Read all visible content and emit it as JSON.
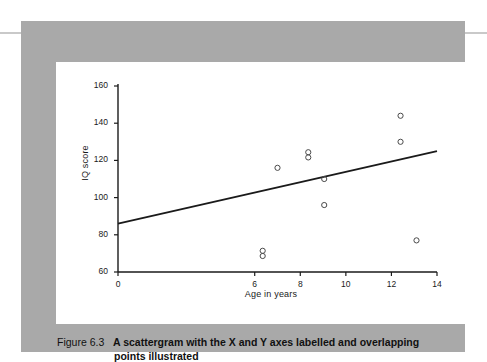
{
  "figure": {
    "number_label": "Figure 6.3",
    "caption_line1": "A scattergram with the X and Y axes labelled and overlapping",
    "caption_line2": "points illustrated"
  },
  "colors": {
    "panel_background": "#ffffff",
    "block_background": "#a9a9a9",
    "axis": "#1a1a1a",
    "trendline": "#1a1a1a",
    "marker_stroke": "#4a4a4a",
    "edge_rule": "#c9c9c9"
  },
  "chart_data": {
    "type": "scatter",
    "title": "",
    "subtitle": "",
    "xlabel": "Age in years",
    "ylabel": "IQ score",
    "xlim": [
      0,
      14
    ],
    "ylim": [
      60,
      160
    ],
    "xticks": [
      0,
      6,
      8,
      10,
      12,
      14
    ],
    "xtick_labels": [
      "0",
      "6",
      "8",
      "10",
      "12",
      "14"
    ],
    "yticks": [
      60,
      80,
      100,
      120,
      140,
      160
    ],
    "ytick_labels": [
      "60",
      "80",
      "100",
      "120",
      "140",
      "160"
    ],
    "grid": false,
    "legend": false,
    "legend_position": "none",
    "axis_break_note": "x axis jumps from 0 directly to 6",
    "series": [
      {
        "name": "Participants",
        "marker": "open-circle",
        "points": [
          {
            "x": 6.35,
            "y": 70,
            "overlapping": true,
            "count": 2
          },
          {
            "x": 7.0,
            "y": 116,
            "overlapping": false,
            "count": 1
          },
          {
            "x": 8.35,
            "y": 123,
            "overlapping": true,
            "count": 2
          },
          {
            "x": 9.05,
            "y": 110,
            "overlapping": false,
            "count": 1
          },
          {
            "x": 9.05,
            "y": 96,
            "overlapping": false,
            "count": 1
          },
          {
            "x": 12.4,
            "y": 144,
            "overlapping": false,
            "count": 1
          },
          {
            "x": 12.4,
            "y": 130,
            "overlapping": false,
            "count": 1
          },
          {
            "x": 13.1,
            "y": 77,
            "overlapping": false,
            "count": 1
          }
        ]
      }
    ],
    "trendline": {
      "name": "Best fit line",
      "x_start": 0,
      "y_start": 86,
      "x_end": 14,
      "y_end": 125
    }
  }
}
